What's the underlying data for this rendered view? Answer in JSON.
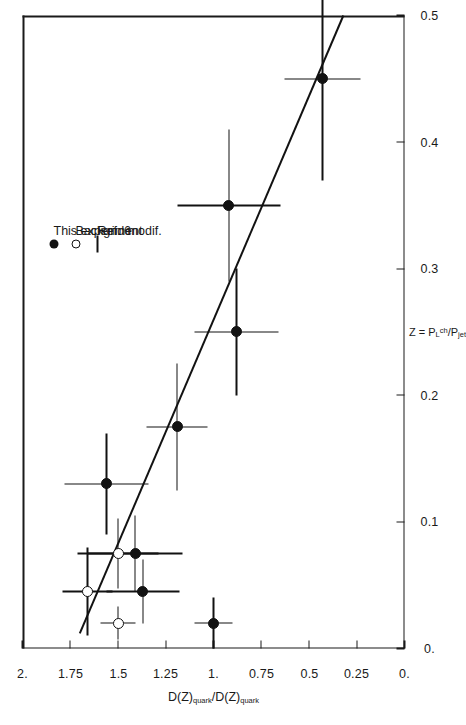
{
  "chart_data": {
    "type": "scatter",
    "title": "",
    "xlabel": "Z = P_L^ch / P_jet",
    "xlabel_parts": {
      "lead": "Z = P",
      "sub1": "L",
      "sup1": "ch",
      "slash": "/P",
      "sub2": "jet"
    },
    "ylabel": "D(Z)quark / D(Z)quark",
    "ylabel_parts": {
      "lead": "D(Z)",
      "sub1": "quark",
      "slash": "/D(Z)",
      "sub2": "quark"
    },
    "xlim": [
      0.0,
      0.5
    ],
    "ylim": [
      0.0,
      2.0
    ],
    "xticks": [
      0.0,
      0.1,
      0.2,
      0.3,
      0.4,
      0.5
    ],
    "xticklabels": [
      "0.",
      "0.1",
      "0.2",
      "0.3",
      "0.4",
      "0.5"
    ],
    "yticks": [
      0.0,
      0.25,
      0.5,
      0.75,
      1.0,
      1.25,
      1.5,
      1.75,
      2.0
    ],
    "yticklabels": [
      "0.",
      "0.25",
      "0.5",
      "0.75",
      "1.",
      "1.25",
      "1.5",
      "1.75",
      "2."
    ],
    "grid": false,
    "legend_position": "upper right",
    "series": [
      {
        "name": "This experiment",
        "marker": "filled-circle",
        "points": [
          {
            "x": 0.02,
            "y": 1.0,
            "xerr": 0.02,
            "yerr": 0.1
          },
          {
            "x": 0.045,
            "y": 1.37,
            "xerr": 0.025,
            "yerr": 0.19
          },
          {
            "x": 0.075,
            "y": 1.41,
            "xerr": 0.03,
            "yerr": 0.25
          },
          {
            "x": 0.13,
            "y": 1.56,
            "xerr": 0.04,
            "yerr": 0.22
          },
          {
            "x": 0.175,
            "y": 1.19,
            "xerr": 0.05,
            "yerr": 0.16
          },
          {
            "x": 0.25,
            "y": 0.88,
            "xerr": 0.05,
            "yerr": 0.22
          },
          {
            "x": 0.35,
            "y": 0.92,
            "xerr": 0.06,
            "yerr": 0.27
          },
          {
            "x": 0.45,
            "y": 0.43,
            "xerr": 0.08,
            "yerr": 0.2
          }
        ]
      },
      {
        "name": "Backgnd modif.",
        "marker": "open-circle",
        "points": [
          {
            "x": 0.02,
            "y": 1.5,
            "xerr": 0.013,
            "yerr": 0.09
          },
          {
            "x": 0.045,
            "y": 1.66,
            "xerr": 0.035,
            "yerr": 0.13
          },
          {
            "x": 0.075,
            "y": 1.5,
            "xerr": 0.028,
            "yerr": 0.21
          }
        ]
      }
    ],
    "fit_line": {
      "name": "Ref. 6",
      "style": "solid",
      "x0": 0.012,
      "y0": 1.7,
      "x1": 0.5,
      "y1": 0.32
    }
  },
  "legend": {
    "entries": [
      {
        "marker": "filled-circle",
        "label": "This experiment"
      },
      {
        "marker": "open-circle",
        "label": "Backgnd modif."
      },
      {
        "marker": "line",
        "label": "Ref. 6"
      }
    ]
  }
}
